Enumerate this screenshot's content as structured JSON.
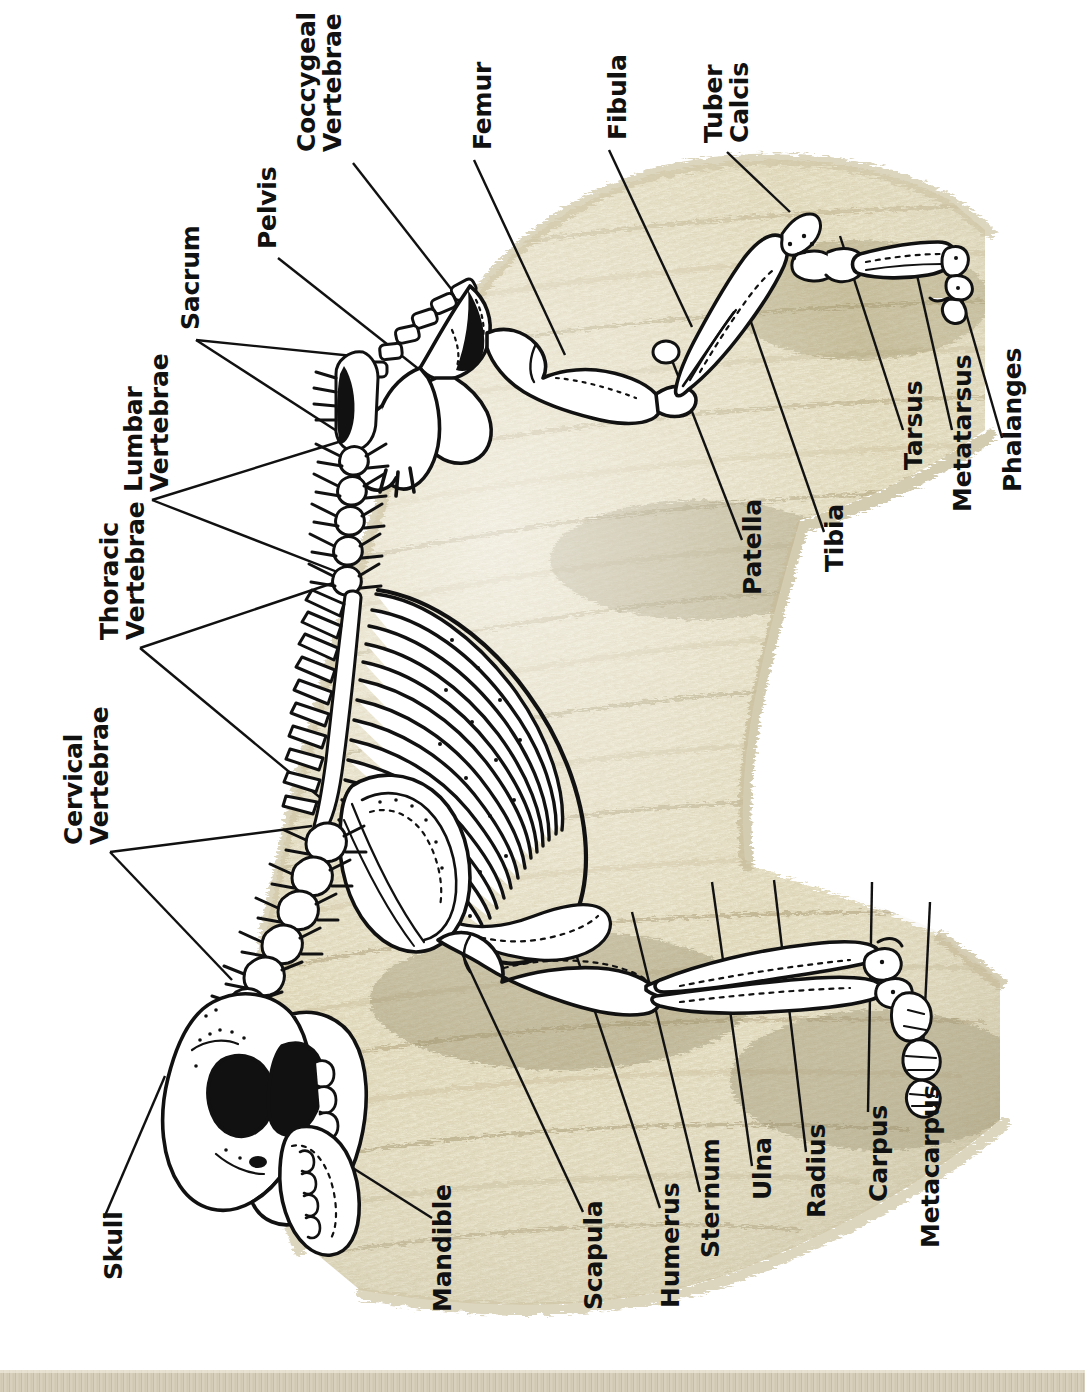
{
  "diagram": {
    "orientation": "rotated-90",
    "colors": {
      "background": "#ffffff",
      "bone_fill": "#ffffff",
      "bone_outline": "#111111",
      "fleece_light": "#f3efdc",
      "fleece_mid": "#e3dcc0",
      "fleece_shadow": "#b9ae8a",
      "fleece_dark": "#8e8460",
      "label_text": "#111111",
      "leader_line": "#111111",
      "ground": "#ddd6c3"
    }
  },
  "labels": [
    {
      "id": "coccygeal-vertebrae",
      "text": "Coccygeal\nVertebrae",
      "lines": 2
    },
    {
      "id": "femur",
      "text": "Femur",
      "lines": 1
    },
    {
      "id": "fibula",
      "text": "Fibula",
      "lines": 1
    },
    {
      "id": "tuber-calcis",
      "text": "Tuber\nCalcis",
      "lines": 2
    },
    {
      "id": "pelvis",
      "text": "Pelvis",
      "lines": 1
    },
    {
      "id": "sacrum",
      "text": "Sacrum",
      "lines": 1
    },
    {
      "id": "lumbar-vertebrae",
      "text": "Lumbar\nVertebrae",
      "lines": 2
    },
    {
      "id": "thoracic-vertebrae",
      "text": "Thoracic\nVertebrae",
      "lines": 2
    },
    {
      "id": "cervical-vertebrae",
      "text": "Cervical\nVertebrae",
      "lines": 2
    },
    {
      "id": "patella",
      "text": "Patella",
      "lines": 1
    },
    {
      "id": "tibia",
      "text": "Tibia",
      "lines": 1
    },
    {
      "id": "tarsus",
      "text": "Tarsus",
      "lines": 1
    },
    {
      "id": "metatarsus",
      "text": "Metatarsus",
      "lines": 1
    },
    {
      "id": "phalanges",
      "text": "Phalanges",
      "lines": 1
    },
    {
      "id": "skull",
      "text": "Skull",
      "lines": 1
    },
    {
      "id": "mandible",
      "text": "Mandible",
      "lines": 1
    },
    {
      "id": "scapula",
      "text": "Scapula",
      "lines": 1
    },
    {
      "id": "humerus",
      "text": "Humerus",
      "lines": 1
    },
    {
      "id": "sternum",
      "text": "Sternum",
      "lines": 1
    },
    {
      "id": "ulna",
      "text": "Ulna",
      "lines": 1
    },
    {
      "id": "radius",
      "text": "Radius",
      "lines": 1
    },
    {
      "id": "carpus",
      "text": "Carpus",
      "lines": 1
    },
    {
      "id": "metacarpus",
      "text": "Metacarpus",
      "lines": 1
    }
  ]
}
